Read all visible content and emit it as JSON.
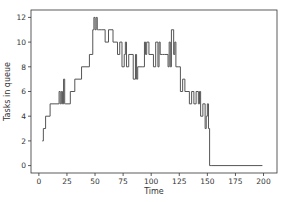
{
  "chart_data": {
    "type": "line",
    "drawstyle": "steps-post",
    "title": "",
    "xlabel": "Time",
    "ylabel": "Tasks in queue",
    "xlim": [
      -7,
      212
    ],
    "ylim": [
      -0.6,
      12.6
    ],
    "xticks": [
      0,
      25,
      50,
      75,
      100,
      125,
      150,
      175,
      200
    ],
    "yticks": [
      0,
      2,
      4,
      6,
      8,
      10,
      12
    ],
    "grid": false,
    "line_color": "#555555",
    "series": [
      {
        "name": "queue",
        "x": [
          3,
          4,
          6,
          10,
          18,
          19,
          20,
          21,
          22,
          23,
          24,
          28,
          32,
          38,
          45,
          48,
          49,
          50,
          51,
          52,
          53,
          56,
          59,
          62,
          66,
          70,
          72,
          74,
          76,
          77,
          78,
          80,
          84,
          86,
          87,
          88,
          92,
          94,
          95,
          96,
          98,
          102,
          104,
          106,
          107,
          108,
          110,
          112,
          115,
          116,
          117,
          118,
          120,
          121,
          122,
          124,
          126,
          128,
          130,
          134,
          136,
          138,
          140,
          142,
          143,
          144,
          146,
          148,
          149,
          150,
          151,
          152,
          154,
          199
        ],
        "y": [
          2,
          3,
          4,
          5,
          6,
          5,
          6,
          5,
          7,
          5,
          5,
          6,
          7,
          8,
          9,
          11,
          12,
          11,
          12,
          11,
          11,
          11,
          10,
          11,
          10,
          9,
          10,
          8,
          9,
          10,
          8,
          9,
          7,
          9,
          7,
          8,
          8,
          10,
          9,
          10,
          9,
          8,
          10,
          8,
          10,
          9,
          9,
          9,
          8,
          10,
          8,
          11,
          9,
          10,
          8,
          8,
          6,
          7,
          6,
          5,
          6,
          5,
          6,
          5,
          6,
          4,
          5,
          3,
          4,
          5,
          3,
          0,
          0,
          0
        ]
      }
    ]
  }
}
